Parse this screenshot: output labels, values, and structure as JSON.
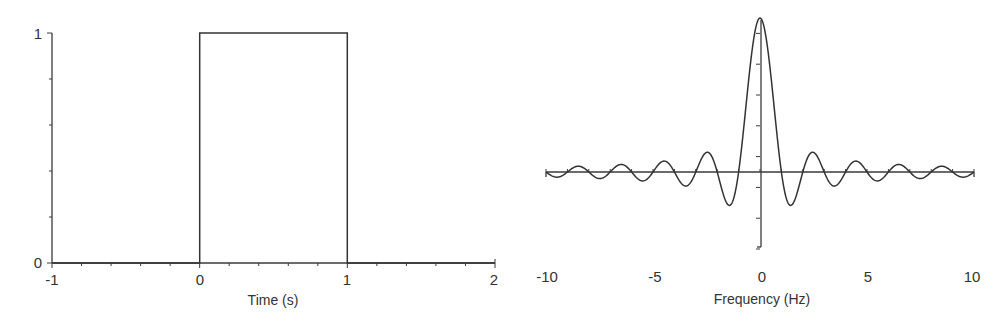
{
  "chart_data": [
    {
      "type": "line",
      "title": "",
      "xlabel": "Time (s)",
      "ylabel": "",
      "xlim": [
        -1,
        2
      ],
      "ylim": [
        0,
        1
      ],
      "x_ticks": [
        -1,
        0,
        1,
        2
      ],
      "x_tick_labels": [
        "-1",
        "0",
        "1",
        "2"
      ],
      "x_minor_tick_step": 0.2,
      "y_ticks": [
        0,
        1
      ],
      "y_tick_labels": [
        "0",
        "1"
      ],
      "y_minor_tick_step": 0.2,
      "grid": false,
      "legend": null,
      "series": [
        {
          "name": "rect pulse",
          "x": [
            -1,
            0,
            0,
            1,
            1,
            2
          ],
          "y": [
            0,
            0,
            1,
            1,
            0,
            0
          ]
        }
      ],
      "description": "Rectangular pulse of height 1 from t=0 to t=1 s"
    },
    {
      "type": "line",
      "title": "",
      "xlabel": "Frequency (Hz)",
      "ylabel": "",
      "xlim": [
        -10,
        10
      ],
      "ylim": [
        -0.5,
        1
      ],
      "x_ticks": [
        -10,
        -5,
        0,
        5,
        10
      ],
      "x_tick_labels": [
        "-10",
        "-5",
        "0",
        "5",
        "10"
      ],
      "x_minor_tick_step": 1,
      "y_ticks": [
        -0.5,
        -0.3,
        -0.1,
        0.1,
        0.3,
        0.5,
        0.7,
        0.9
      ],
      "y_tick_labels": [],
      "grid": false,
      "legend": null,
      "series": [
        {
          "name": "sinc(f)",
          "function": "sin(pi*f)/(pi*f)",
          "x": [
            -10,
            -8.5,
            -7.5,
            -6.5,
            -5.5,
            -4.5,
            -3.5,
            -2.5,
            -1.43,
            -1,
            0,
            1,
            1.43,
            2.5,
            3.5,
            4.5,
            5.5,
            6.5,
            7.5,
            8.5,
            10
          ],
          "y": [
            0,
            0.037,
            -0.042,
            0.049,
            -0.058,
            0.071,
            -0.091,
            0.128,
            -0.217,
            0,
            1,
            0,
            -0.217,
            0.128,
            -0.091,
            0.071,
            -0.058,
            0.049,
            -0.042,
            0.037,
            0
          ]
        }
      ],
      "description": "Sinc spectrum of the rectangular pulse, main lobe at 0 Hz with zeros at integer frequencies"
    }
  ],
  "left_chart": {
    "xlabel": "Time (s)",
    "x_tick_labels": [
      "-1",
      "0",
      "1",
      "2"
    ],
    "y_tick_labels": [
      "0",
      "1"
    ]
  },
  "right_chart": {
    "xlabel": "Frequency (Hz)",
    "x_tick_labels": [
      "-10",
      "-5",
      "0",
      "5",
      "10"
    ]
  }
}
